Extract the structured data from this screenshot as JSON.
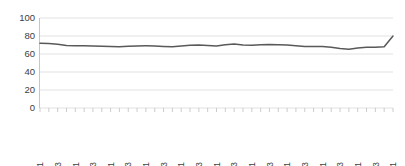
{
  "chart_data": {
    "type": "line",
    "title": "",
    "subtitle": "",
    "xlabel": "",
    "ylabel": "",
    "ylim": [
      0,
      100
    ],
    "ytick_labels": [
      "0",
      "20",
      "40",
      "60",
      "80",
      "100"
    ],
    "ytick_values": [
      0,
      20,
      40,
      60,
      80,
      100
    ],
    "grid": true,
    "legend": false,
    "legend_position": "none",
    "categories": [
      "2000Q1",
      "2000Q2",
      "2000Q3",
      "2000Q4",
      "2001Q1",
      "2001Q2",
      "2001Q3",
      "2001Q4",
      "2002Q1",
      "2002Q2",
      "2002Q3",
      "2002Q4",
      "2003Q1",
      "2003Q2",
      "2003Q3",
      "2003Q4",
      "2004Q1",
      "2004Q2",
      "2004Q3",
      "2004Q4",
      "2005Q1",
      "2005Q2",
      "2005Q3",
      "2005Q4",
      "2006Q1",
      "2006Q2",
      "2006Q3",
      "2006Q4",
      "2007Q1",
      "2007Q2",
      "2007Q3",
      "2007Q4",
      "2008Q1",
      "2008Q2",
      "2008Q3",
      "2008Q4",
      "2009Q1",
      "2009Q2",
      "2009Q3",
      "2009Q4",
      "2010Q1"
    ],
    "xtick_labels_shown": [
      "2000Q1",
      "2000Q3",
      "2001Q1",
      "2001Q3",
      "2002Q1",
      "2002Q3",
      "2003Q1",
      "2003Q3",
      "2004Q1",
      "2004Q3",
      "2005Q1",
      "2005Q3",
      "2006Q1",
      "2006Q3",
      "2007Q1",
      "2007Q3",
      "2008Q1",
      "2008Q3",
      "2009Q1",
      "2009Q3",
      "2010Q1"
    ],
    "xtick_label_rotation": -90,
    "values": [
      72.0,
      71.6,
      70.8,
      69.4,
      69.2,
      69.1,
      69.0,
      68.6,
      68.2,
      68.0,
      68.6,
      69.0,
      69.1,
      69.0,
      68.4,
      68.0,
      68.8,
      69.8,
      70.0,
      69.4,
      69.0,
      70.2,
      71.0,
      70.0,
      69.6,
      70.4,
      70.6,
      70.4,
      70.0,
      69.2,
      68.2,
      68.2,
      68.4,
      67.6,
      66.0,
      65.4,
      66.6,
      67.4,
      67.6,
      68.0,
      80.0
    ],
    "series": [
      {
        "name": "series-1",
        "color": "#595959",
        "values": [
          72.0,
          71.6,
          70.8,
          69.4,
          69.2,
          69.1,
          69.0,
          68.6,
          68.2,
          68.0,
          68.6,
          69.0,
          69.1,
          69.0,
          68.4,
          68.0,
          68.8,
          69.8,
          70.0,
          69.4,
          69.0,
          70.2,
          71.0,
          70.0,
          69.6,
          70.4,
          70.6,
          70.4,
          70.0,
          69.2,
          68.2,
          68.2,
          68.4,
          67.6,
          66.0,
          65.4,
          66.6,
          67.4,
          67.6,
          68.0,
          80.0
        ]
      }
    ],
    "colors": {
      "line": "#595959",
      "gridline": "#d9d9d9",
      "axis": "#bfbfbf",
      "text": "#404040",
      "background": "#ffffff"
    }
  }
}
